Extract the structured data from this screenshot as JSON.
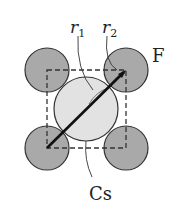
{
  "diagram": {
    "labels": {
      "r1": "r",
      "r1_sub": "1",
      "r2": "r",
      "r2_sub": "2",
      "anion": "F",
      "cation": "Cs"
    },
    "colors": {
      "anion_fill": "#a9a9a9",
      "cation_fill": "#e2e2e2",
      "stroke": "#333333"
    }
  }
}
